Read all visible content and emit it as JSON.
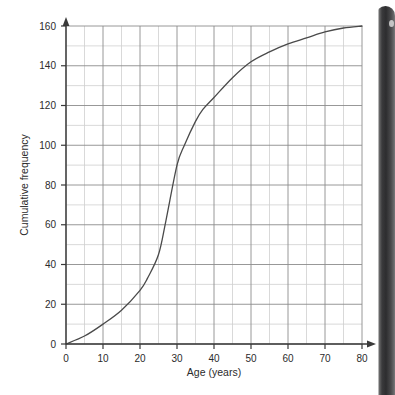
{
  "page": {
    "background_color": "#ffffff"
  },
  "device": {
    "bezel_name": "phone-bezel",
    "bezel_color": "#2d2d2f"
  },
  "chart_data": {
    "type": "line",
    "title": "",
    "subtitle": "",
    "xlabel": "Age (years)",
    "ylabel": "Cumulative frequency",
    "xlim": [
      0,
      80
    ],
    "ylim": [
      0,
      160
    ],
    "x_major_ticks": [
      0,
      10,
      20,
      30,
      40,
      50,
      60,
      70,
      80
    ],
    "x_minor_step": 5,
    "y_major_ticks": [
      0,
      20,
      40,
      60,
      80,
      100,
      120,
      140,
      160
    ],
    "y_minor_step": 10,
    "x_tick_labels": [
      "0",
      "10",
      "20",
      "30",
      "40",
      "50",
      "60",
      "70",
      "80"
    ],
    "y_tick_labels": [
      "0",
      "20",
      "40",
      "60",
      "80",
      "100",
      "120",
      "140",
      "160"
    ],
    "grid": true,
    "grid_major_color": "#8c8c8c",
    "grid_minor_color": "#cfcfcf",
    "axis_color": "#3a3a3a",
    "legend": null,
    "legend_position": "none",
    "annotations": [],
    "series": [
      {
        "name": "Cumulative frequency",
        "color": "#4a4a4a",
        "line_width": 1.3,
        "x": [
          0,
          5,
          10,
          15,
          20,
          22,
          25,
          27,
          30,
          32,
          35,
          37,
          40,
          45,
          50,
          55,
          60,
          65,
          70,
          75,
          80
        ],
        "values": [
          0,
          4,
          10,
          17,
          27,
          33,
          45,
          62,
          90,
          100,
          112,
          118,
          124,
          134,
          142,
          147,
          151,
          154,
          157,
          159,
          160
        ]
      }
    ]
  }
}
